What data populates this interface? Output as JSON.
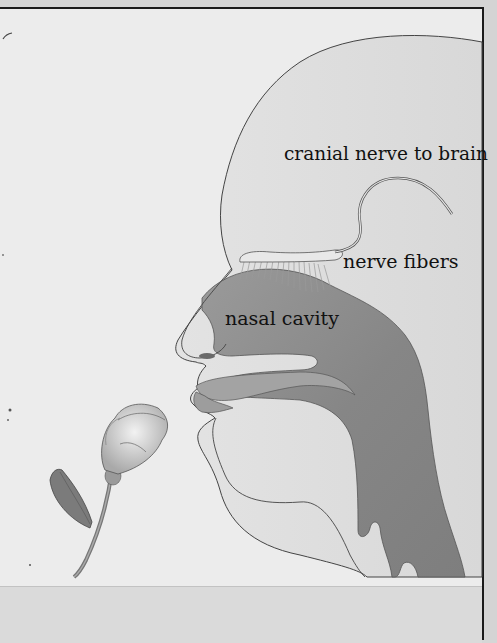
{
  "diagram": {
    "labels": {
      "cranial_nerve": "cranial nerve to brain",
      "nerve_fibers": "nerve fibers",
      "nasal_cavity": "nasal cavity"
    },
    "colors": {
      "background": "#ececec",
      "head_fill": "#dedede",
      "airway_fill": "#8f8f8f",
      "outline": "#3a3a3a",
      "frame": "#1a1a1a"
    }
  }
}
